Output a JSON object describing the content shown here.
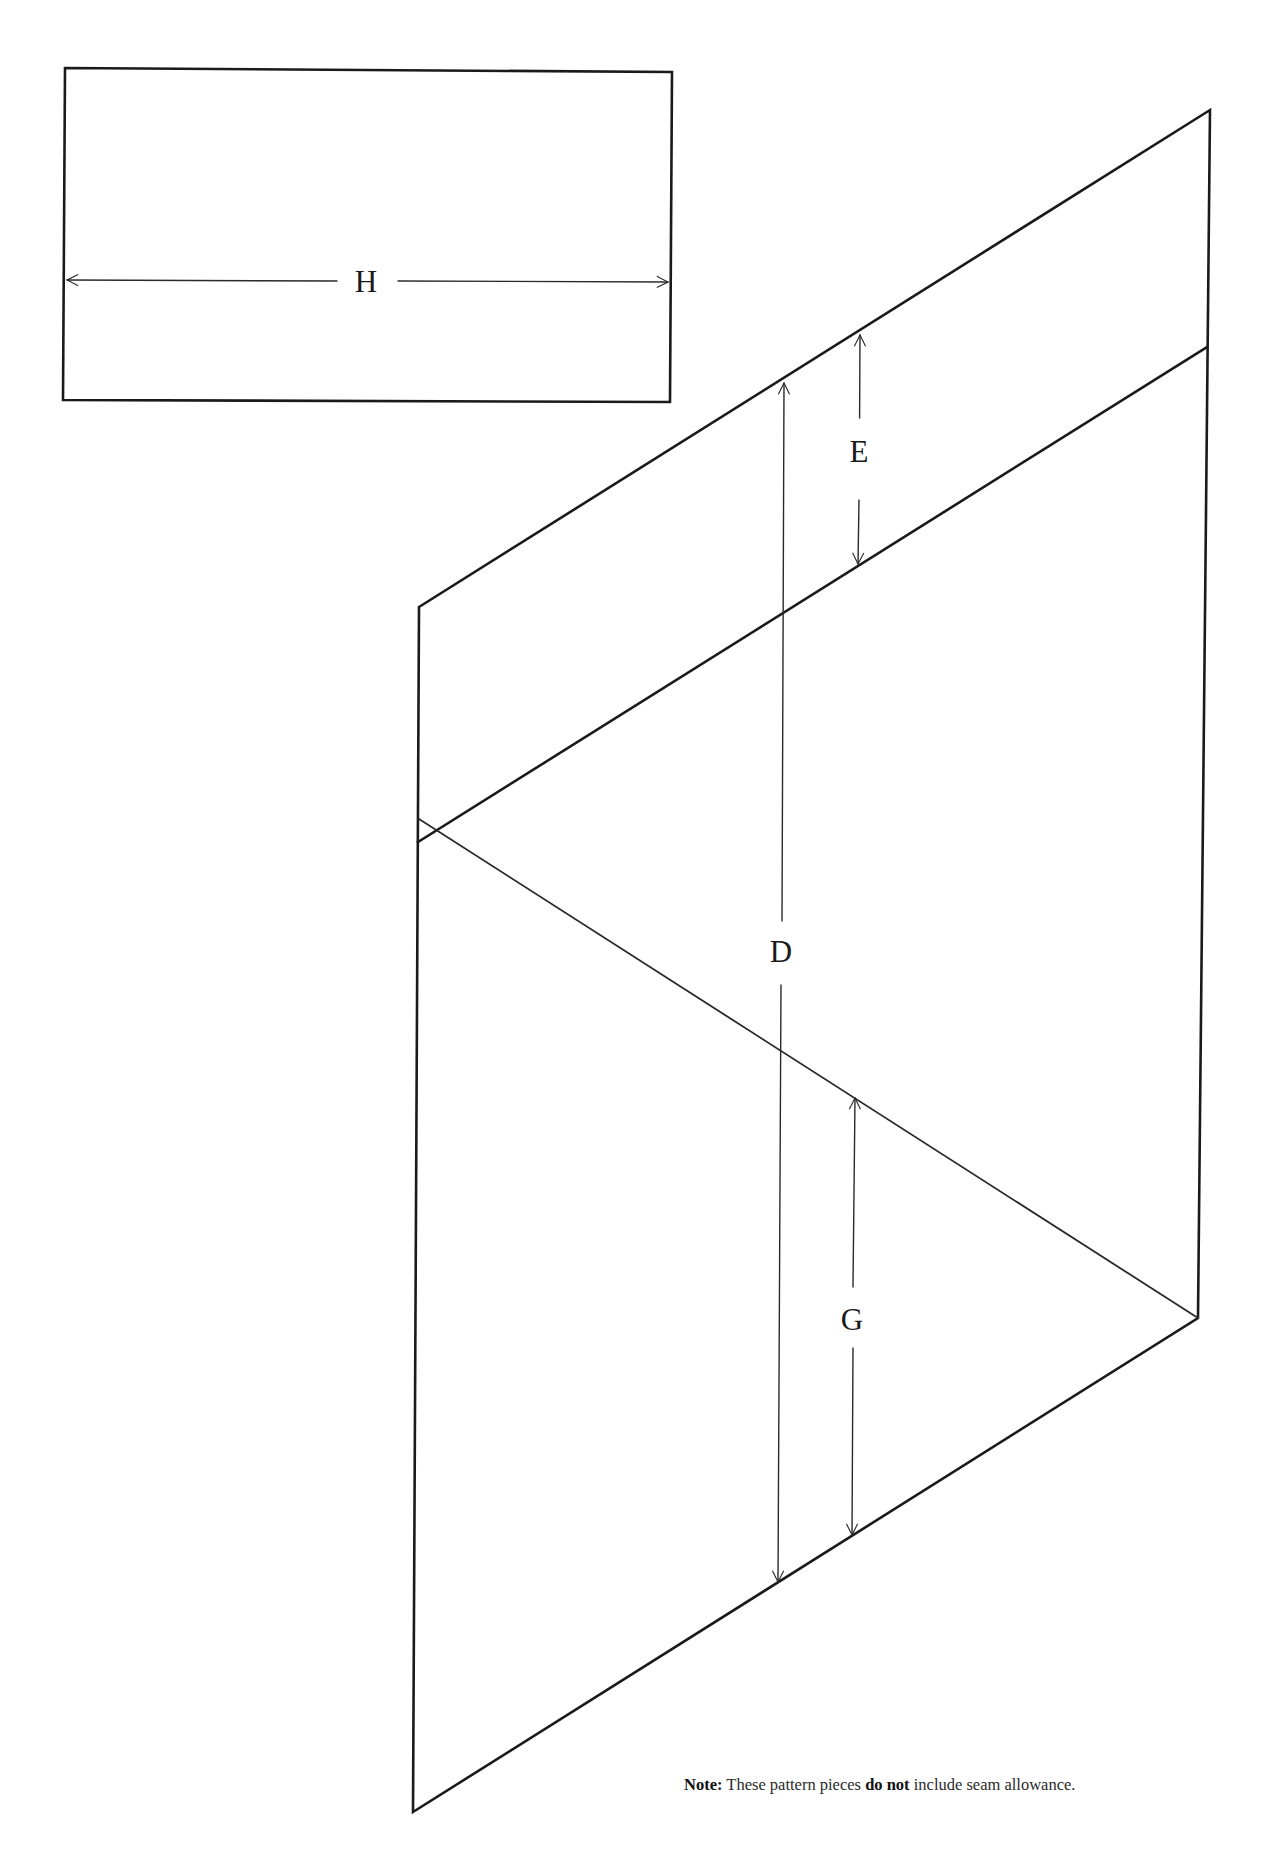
{
  "page": {
    "title_cut_off": "",
    "background": "#ffffff",
    "line_color": "#1a1a1a"
  },
  "pieces": {
    "rectangle": {
      "corners": [
        [
          65,
          68
        ],
        [
          672,
          72
        ],
        [
          670,
          402
        ],
        [
          63,
          400
        ]
      ],
      "dimension": {
        "label": "H",
        "from": [
          65,
          280
        ],
        "to": [
          670,
          282
        ],
        "label_pos": [
          366,
          292
        ]
      }
    },
    "parallelogram": {
      "outline": [
        [
          419,
          607
        ],
        [
          1210,
          110
        ],
        [
          1198,
          1318
        ],
        [
          413,
          1812
        ]
      ],
      "fold_line": {
        "from": [
          418,
          842
        ],
        "to": [
          1207,
          347
        ]
      },
      "diagonal_line": {
        "from": [
          419,
          819
        ],
        "to": [
          1198,
          1318
        ]
      },
      "dimensions": [
        {
          "label": "E",
          "from": [
            860,
            333
          ],
          "to": [
            858,
            566
          ],
          "label_pos": [
            859,
            462
          ],
          "gap": [
            418,
            500
          ]
        },
        {
          "label": "D",
          "from": [
            784,
            381
          ],
          "to": [
            778,
            1584
          ],
          "label_pos": [
            781,
            962
          ],
          "gap": [
            921,
            985
          ]
        },
        {
          "label": "G",
          "from": [
            855,
            1096
          ],
          "to": [
            852,
            1537
          ],
          "label_pos": [
            852,
            1330
          ],
          "gap": [
            1287,
            1348
          ]
        }
      ]
    }
  },
  "note": {
    "prefix": "Note:",
    "text_before": " These pattern pieces ",
    "emphasis": "do not",
    "text_after": " include seam allowance."
  }
}
